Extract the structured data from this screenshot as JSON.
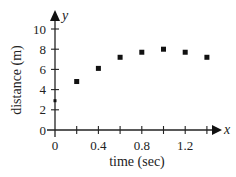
{
  "chart_data": {
    "type": "scatter",
    "title": "",
    "xlabel": "time (sec)",
    "ylabel": "distance (m)",
    "x_axis_var": "x",
    "y_axis_var": "y",
    "xlim": [
      0,
      1.5
    ],
    "ylim": [
      0,
      10
    ],
    "x_ticks": [
      0,
      0.2,
      0.4,
      0.6,
      0.8,
      1.0,
      1.2,
      1.4
    ],
    "x_tick_labels": [
      "0",
      "0.4",
      "0.8",
      "1.2"
    ],
    "y_ticks": [
      0,
      2,
      4,
      6,
      8,
      10
    ],
    "y_tick_labels": [
      "0",
      "2",
      "4",
      "6",
      "8",
      "10"
    ],
    "grid": false,
    "legend": null,
    "x": [
      0,
      0.2,
      0.4,
      0.6,
      0.8,
      1.0,
      1.2,
      1.4
    ],
    "y": [
      2.9,
      4.8,
      6.1,
      7.2,
      7.7,
      8.0,
      7.7,
      7.2
    ],
    "marker": "square",
    "color": "#111111"
  }
}
